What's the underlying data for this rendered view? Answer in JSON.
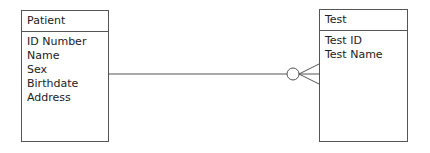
{
  "entities": [
    {
      "title": "Patient",
      "attributes": [
        "ID Number",
        "Name",
        "Sex",
        "Birthdate",
        "Address"
      ]
    },
    {
      "title": "Test",
      "attributes": [
        "Test ID",
        "Test Name"
      ]
    }
  ],
  "relationship": {
    "from": "Patient",
    "to": "Test",
    "to_cardinality": "zero-or-many"
  }
}
